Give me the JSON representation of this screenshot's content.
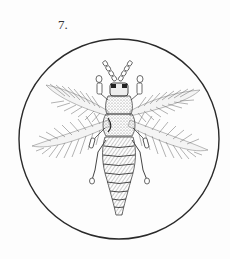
{
  "plate": {
    "figure_number": "7.",
    "subject": "thrips insect illustration",
    "colors": {
      "background": "#fdfdfd",
      "ink": "#333333",
      "circle": "#2a2a2a"
    },
    "frame": {
      "cx": 119,
      "cy": 139,
      "r": 100
    }
  }
}
